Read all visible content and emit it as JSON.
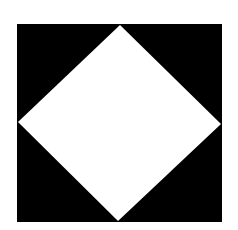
{
  "figure": {
    "background_color": "#ffffff",
    "square": {
      "color": "#000000",
      "x": 17,
      "y": 24,
      "width": 205,
      "height": 198
    },
    "diamond": {
      "color": "#ffffff",
      "points": "120,25 221,124 118,221 18,122"
    }
  }
}
